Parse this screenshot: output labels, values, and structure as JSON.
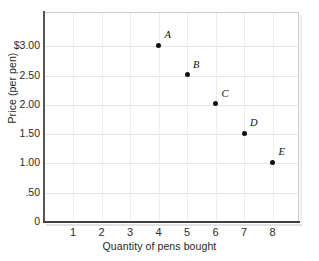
{
  "chart_data": {
    "type": "scatter",
    "title": "",
    "xlabel": "Quantity of pens bought",
    "ylabel": "Price (per pen)",
    "xlim": [
      0,
      9
    ],
    "ylim": [
      0,
      3.5
    ],
    "grid": true,
    "legend": "none",
    "x_ticks": [
      "1",
      "2",
      "3",
      "4",
      "5",
      "6",
      "7",
      "8"
    ],
    "x_tick_values": [
      1,
      2,
      3,
      4,
      5,
      6,
      7,
      8
    ],
    "y_ticks": [
      "0",
      ".50",
      "1.00",
      "1.50",
      "2.00",
      "2.50",
      "$3.00"
    ],
    "y_tick_values": [
      0,
      0.5,
      1.0,
      1.5,
      2.0,
      2.5,
      3.0
    ],
    "points": [
      {
        "label": "A",
        "x": 4,
        "y": 3.0
      },
      {
        "label": "B",
        "x": 5,
        "y": 2.5
      },
      {
        "label": "C",
        "x": 6,
        "y": 2.0
      },
      {
        "label": "D",
        "x": 7,
        "y": 1.5
      },
      {
        "label": "E",
        "x": 8,
        "y": 1.0
      }
    ],
    "marker_color": "#111111",
    "grid_color": "#e6e6e6",
    "axis_color": "#3d3f42",
    "background": "#ffffff"
  }
}
